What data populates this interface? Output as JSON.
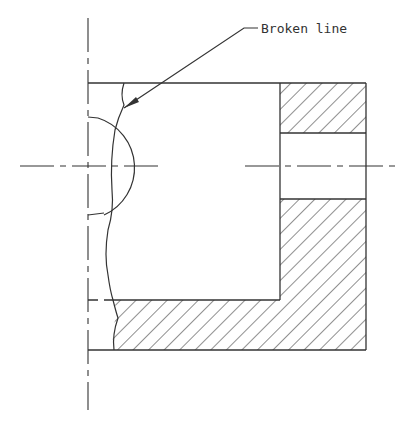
{
  "drawing": {
    "title": "Broken line section drawing",
    "annotation": "Broken line",
    "colors": {
      "line": "#333333",
      "background": "#ffffff"
    }
  }
}
